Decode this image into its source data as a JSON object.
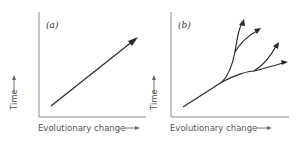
{
  "figure": {
    "panels": [
      {
        "id": "a",
        "label": "(a)",
        "description": "Linear evolution: single lineage changing steadily over time",
        "x_axis_label": "Evolutionary change",
        "y_axis_label": "Time"
      },
      {
        "id": "b",
        "label": "(b)",
        "description": "Branching evolution: lineage splits into multiple descendant lineages",
        "x_axis_label": "Evolutionary change",
        "y_axis_label": "Time"
      }
    ],
    "colors": {
      "line": "#2a2a2a",
      "axis": "#8a8a8a",
      "text": "#555555"
    }
  }
}
